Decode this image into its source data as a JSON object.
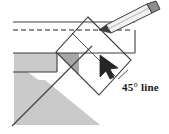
{
  "diagram": {
    "annotations": [
      {
        "id": "angle-label",
        "text": "45° line"
      }
    ],
    "colors": {
      "background": "#ffffff",
      "outline": "#3c3c3c",
      "light_gray_fill": "#c9c9c9",
      "medium_gray_fill": "#a6a6a6",
      "pencil_body": "#e8e8e8",
      "pencil_tip": "#8c8c8c",
      "cursor": "#262626",
      "dashed_line": "#6e6e6e"
    },
    "parts": [
      {
        "name": "horizontal-bar",
        "label": "horizontal workpiece bar"
      },
      {
        "name": "dashed-centerline",
        "label": "dashed center reference line"
      },
      {
        "name": "rotated-block",
        "label": "rotated 45 degree block"
      },
      {
        "name": "gray-triangle",
        "label": "large gray triangular base"
      },
      {
        "name": "gray-wedge",
        "label": "dark gray wedge"
      },
      {
        "name": "gray-step-block",
        "label": "gray step block"
      },
      {
        "name": "pencil",
        "label": "pencil pointer"
      },
      {
        "name": "mouse-cursor",
        "label": "mouse cursor arrow"
      },
      {
        "name": "diagonal-guide-line",
        "label": "45 degree diagonal guide line"
      }
    ]
  }
}
